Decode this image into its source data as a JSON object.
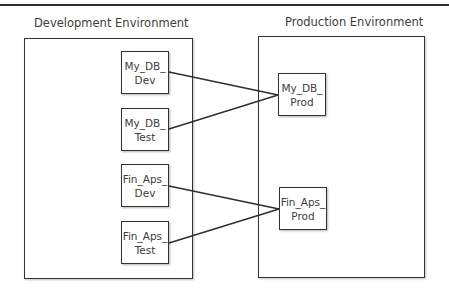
{
  "diagram": {
    "environments": [
      {
        "id": "dev",
        "label": "Development Environment"
      },
      {
        "id": "prod",
        "label": "Production Environment"
      }
    ],
    "nodes": [
      {
        "id": "my_db_dev",
        "line1": "My_DB_",
        "line2": "Dev",
        "environment": "dev"
      },
      {
        "id": "my_db_test",
        "line1": "My_DB_",
        "line2": "Test",
        "environment": "dev"
      },
      {
        "id": "fin_aps_dev",
        "line1": "Fin_Aps_",
        "line2": "Dev",
        "environment": "dev"
      },
      {
        "id": "fin_aps_test",
        "line1": "Fin_Aps_",
        "line2": "Test",
        "environment": "dev"
      },
      {
        "id": "my_db_prod",
        "line1": "My_DB_",
        "line2": "Prod",
        "environment": "prod"
      },
      {
        "id": "fin_aps_prod",
        "line1": "Fin_Aps_",
        "line2": "Prod",
        "environment": "prod"
      }
    ],
    "edges": [
      {
        "from": "my_db_dev",
        "to": "my_db_prod"
      },
      {
        "from": "my_db_test",
        "to": "my_db_prod"
      },
      {
        "from": "fin_aps_dev",
        "to": "fin_aps_prod"
      },
      {
        "from": "fin_aps_test",
        "to": "fin_aps_prod"
      }
    ]
  }
}
